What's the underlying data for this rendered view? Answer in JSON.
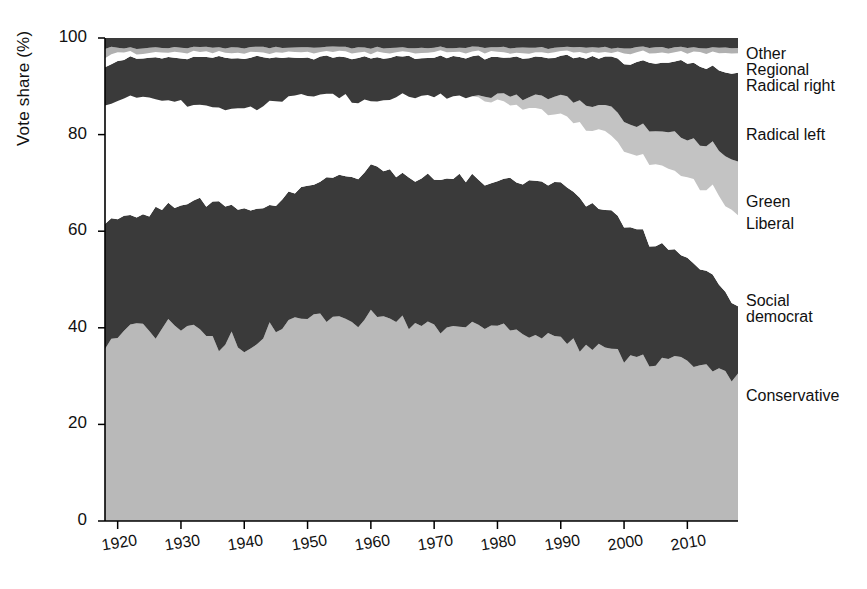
{
  "chart_data": {
    "type": "area",
    "stacked": true,
    "title": "",
    "xlabel": "",
    "ylabel": "Vote share (%)",
    "ylim": [
      0,
      100
    ],
    "xlim": [
      1918,
      2018
    ],
    "yticks": [
      0,
      20,
      40,
      60,
      80,
      100
    ],
    "xticks": [
      1920,
      1930,
      1940,
      1950,
      1960,
      1970,
      1980,
      1990,
      2000,
      2010
    ],
    "grid": false,
    "legend_position": "right-outside",
    "x": [
      1918,
      1920,
      1922,
      1924,
      1926,
      1928,
      1930,
      1932,
      1934,
      1936,
      1938,
      1940,
      1942,
      1944,
      1946,
      1948,
      1950,
      1952,
      1954,
      1956,
      1958,
      1960,
      1962,
      1964,
      1966,
      1968,
      1970,
      1972,
      1974,
      1976,
      1978,
      1980,
      1982,
      1984,
      1986,
      1988,
      1990,
      1992,
      1994,
      1996,
      1998,
      2000,
      2002,
      2004,
      2006,
      2008,
      2010,
      2012,
      2014,
      2016,
      2018
    ],
    "series": [
      {
        "name": "Conservative",
        "color": "#b9b9b9",
        "values": [
          36,
          38,
          40,
          41,
          39,
          40,
          41,
          40,
          39,
          36,
          38,
          34,
          36,
          41,
          40,
          41,
          42,
          42,
          41,
          42,
          41,
          42,
          41,
          42,
          41,
          40,
          40,
          41,
          40,
          40,
          40,
          41,
          40,
          39,
          38,
          39,
          38,
          37,
          36,
          36,
          35,
          34,
          34,
          33,
          34,
          33,
          33,
          32,
          32,
          31,
          30
        ]
      },
      {
        "name": "Social democrat",
        "color": "#3a3a3a",
        "values": [
          26,
          25,
          23,
          22,
          26,
          25,
          25,
          26,
          27,
          30,
          28,
          31,
          28,
          24,
          27,
          27,
          27,
          28,
          30,
          30,
          31,
          31,
          31,
          30,
          31,
          31,
          31,
          30,
          31,
          31,
          31,
          30,
          31,
          31,
          32,
          31,
          31,
          31,
          30,
          29,
          28,
          27,
          26,
          25,
          24,
          22,
          21,
          20,
          19,
          17,
          15
        ]
      },
      {
        "name": "Liberal",
        "color": "#ffffff",
        "values": [
          24,
          24,
          25,
          25,
          22,
          22,
          21,
          20,
          20,
          19,
          20,
          21,
          21,
          22,
          20,
          20,
          19,
          18,
          17,
          16,
          15,
          14,
          15,
          16,
          16,
          17,
          17,
          17,
          17,
          17,
          17,
          17,
          16,
          16,
          15,
          15,
          15,
          15,
          15,
          16,
          16,
          16,
          16,
          16,
          16,
          17,
          17,
          17,
          18,
          18,
          19
        ]
      },
      {
        "name": "Green",
        "color": "#c3c3c3",
        "values": [
          0,
          0,
          0,
          0,
          0,
          0,
          0,
          0,
          0,
          0,
          0,
          0,
          0,
          0,
          0,
          0,
          0,
          0,
          0,
          0,
          0,
          0,
          0,
          0,
          0,
          0,
          0,
          0,
          0,
          0,
          1,
          1,
          2,
          2,
          3,
          3,
          4,
          4,
          5,
          5,
          6,
          6,
          6,
          7,
          7,
          8,
          8,
          9,
          9,
          10,
          11
        ]
      },
      {
        "name": "Radical left",
        "color": "#3a3a3a",
        "values": [
          8,
          8,
          8,
          8,
          9,
          9,
          9,
          10,
          10,
          11,
          10,
          10,
          11,
          9,
          9,
          8,
          8,
          8,
          8,
          8,
          9,
          9,
          9,
          8,
          8,
          8,
          8,
          8,
          8,
          8,
          8,
          8,
          8,
          8,
          8,
          8,
          8,
          9,
          10,
          10,
          11,
          12,
          13,
          14,
          14,
          15,
          16,
          16,
          16,
          17,
          18
        ]
      },
      {
        "name": "Radical right",
        "color": "#ffffff",
        "values": [
          2,
          2,
          1,
          1,
          1,
          1,
          1,
          1,
          1,
          1,
          1,
          1,
          1,
          1,
          1,
          1,
          1,
          1,
          1,
          1,
          1,
          1,
          1,
          1,
          1,
          1,
          1,
          1,
          1,
          1,
          1,
          1,
          1,
          1,
          1,
          1,
          1,
          1,
          1,
          1,
          1,
          2,
          2,
          2,
          2,
          2,
          2,
          3,
          3,
          4,
          4
        ]
      },
      {
        "name": "Regional",
        "color": "#b0b0b0",
        "values": [
          2,
          1,
          1,
          1,
          1,
          1,
          1,
          1,
          1,
          1,
          1,
          1,
          1,
          1,
          1,
          1,
          1,
          1,
          1,
          1,
          1,
          1,
          1,
          1,
          1,
          1,
          1,
          1,
          1,
          1,
          1,
          1,
          1,
          1,
          1,
          1,
          1,
          1,
          1,
          1,
          1,
          1,
          1,
          1,
          1,
          1,
          1,
          1,
          1,
          1,
          1
        ]
      },
      {
        "name": "Other",
        "color": "#3a3a3a",
        "values": [
          2,
          2,
          2,
          2,
          2,
          2,
          2,
          2,
          2,
          2,
          2,
          2,
          2,
          2,
          2,
          2,
          2,
          2,
          2,
          2,
          2,
          2,
          2,
          2,
          2,
          2,
          2,
          2,
          2,
          2,
          2,
          2,
          2,
          2,
          2,
          2,
          2,
          2,
          2,
          2,
          2,
          2,
          2,
          2,
          2,
          2,
          2,
          2,
          2,
          2,
          2
        ]
      }
    ],
    "legend_labels": [
      {
        "label": "Other",
        "y": 45
      },
      {
        "label": "Regional",
        "y": 61
      },
      {
        "label": "Radical right",
        "y": 77
      },
      {
        "label": "Radical left",
        "y": 126
      },
      {
        "label": "Green",
        "y": 193
      },
      {
        "label": "Liberal",
        "y": 215
      },
      {
        "label": "Social",
        "y": 292
      },
      {
        "label": "democrat",
        "y": 308
      },
      {
        "label": "Conservative",
        "y": 387
      }
    ]
  }
}
